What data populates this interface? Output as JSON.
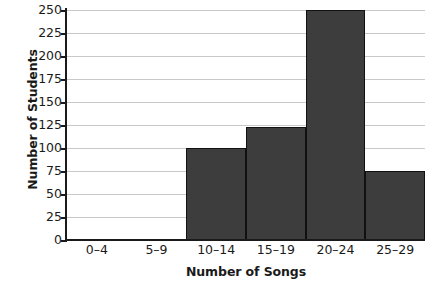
{
  "chart_data": {
    "type": "bar",
    "title": "",
    "subtitle": "",
    "xlabel": "Number of Songs",
    "ylabel": "Number of Students",
    "categories": [
      "0–4",
      "5–9",
      "10–14",
      "15–19",
      "20–24",
      "25–29"
    ],
    "values": [
      0,
      0,
      100,
      123,
      250,
      75
    ],
    "ylim": [
      0,
      250
    ],
    "ytick_values": [
      0,
      25,
      50,
      75,
      100,
      125,
      150,
      175,
      200,
      225,
      250
    ],
    "ytick_labels": [
      "0",
      "25",
      "50",
      "75",
      "100",
      "125",
      "150",
      "175",
      "200",
      "225",
      "250"
    ],
    "grid": true,
    "grid_axis": "y",
    "legend": false,
    "bar_gap": 0,
    "series": [
      {
        "name": "Number of Students",
        "values": [
          0,
          0,
          100,
          123,
          250,
          75
        ]
      }
    ]
  },
  "style": {
    "bar_fill": "#3d3d3d",
    "bar_edge": "#111111",
    "gridline_color": "#c9c9c9",
    "axis_color": "#1a1a1a",
    "background": "#ffffff",
    "text_color": "#1a1a1a"
  }
}
